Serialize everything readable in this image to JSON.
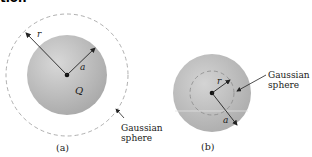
{
  "heading_fragment": "tion",
  "figure_a": {
    "caption": "(a)",
    "radius_outer_label": "r",
    "radius_inner_label": "a",
    "charge_label": "Q",
    "gaussian_label_line1": "Gaussian",
    "gaussian_label_line2": "sphere"
  },
  "figure_b": {
    "caption": "(b)",
    "radius_inner_label": "r",
    "radius_outer_label": "a",
    "gaussian_label_line1": "Gaussian",
    "gaussian_label_line2": "sphere"
  },
  "colors": {
    "sphere_fill": "#b8b8b8",
    "sphere_highlight": "#d6d6d6",
    "dashed_circle": "#999999",
    "arrows": "#222222"
  }
}
